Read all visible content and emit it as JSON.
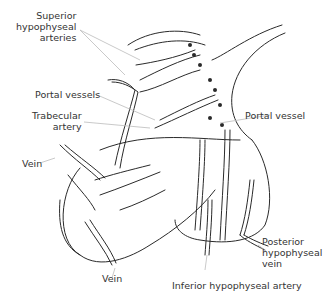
{
  "diagram": {
    "labels": {
      "superior_arteries": [
        "Superior",
        "hypophyseal",
        "arteries"
      ],
      "portal_vessels": "Portal vessels",
      "trabecular_artery": [
        "Trabecular",
        "artery"
      ],
      "portal_vessel": "Portal vessel",
      "vein_left": "Vein",
      "vein_bottom": "Vein",
      "posterior_vein": [
        "Posterior",
        "hypophyseal",
        "vein"
      ],
      "inferior_artery": "Inferior hypophyseal artery"
    },
    "colors": {
      "line": "#2a2a2a",
      "leader": "#bbbbbb",
      "text": "#333333",
      "background": "#ffffff"
    }
  }
}
